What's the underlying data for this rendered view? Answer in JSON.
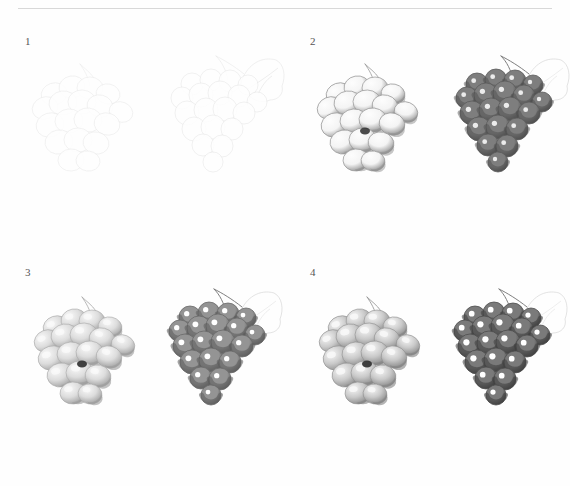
{
  "document": {
    "kind": "art-instruction-page",
    "background_color": "#fefefe",
    "rule_color": "#d8d8d8",
    "subject": "grapes"
  },
  "panels": [
    {
      "number": "1",
      "stage_name": "outline",
      "figures": [
        {
          "id": "green-grapes",
          "variety_label": "light grapes",
          "outline_color": "#e8e8e8",
          "fill_color": "#ffffff",
          "highlight_color": "#ffffff",
          "shadow_color": "#f2f2f2",
          "berries": 16,
          "has_leaf": false,
          "has_stem": true
        },
        {
          "id": "dark-grapes",
          "variety_label": "dark grapes",
          "outline_color": "#e4e4e4",
          "fill_color": "#ffffff",
          "highlight_color": "#ffffff",
          "shadow_color": "#f0f0f0",
          "berries": 20,
          "has_leaf": true,
          "has_stem": true
        }
      ]
    },
    {
      "number": "2",
      "stage_name": "first tone",
      "figures": [
        {
          "id": "green-grapes",
          "variety_label": "light grapes",
          "outline_color": "#9a9a9a",
          "fill_color": "#f4f4f4",
          "highlight_color": "#fdfdfd",
          "shadow_color": "#8d8d8d",
          "berries": 16,
          "has_leaf": false,
          "has_stem": true
        },
        {
          "id": "dark-grapes",
          "variety_label": "dark grapes",
          "outline_color": "#5c5c5c",
          "fill_color": "#7e7e7e",
          "highlight_color": "#ffffff",
          "shadow_color": "#4a4a4a",
          "berries": 20,
          "has_leaf": true,
          "has_stem": true
        }
      ]
    },
    {
      "number": "3",
      "stage_name": "modelling",
      "figures": [
        {
          "id": "green-grapes",
          "variety_label": "light grapes",
          "outline_color": "#a8a8a8",
          "fill_color": "#dcdcdc",
          "highlight_color": "#fafafa",
          "shadow_color": "#9c9c9c",
          "berries": 16,
          "has_leaf": false,
          "has_stem": true
        },
        {
          "id": "dark-grapes",
          "variety_label": "dark grapes",
          "outline_color": "#6a6a6a",
          "fill_color": "#949494",
          "highlight_color": "#ffffff",
          "shadow_color": "#5a5a5a",
          "berries": 20,
          "has_leaf": true,
          "has_stem": true
        }
      ]
    },
    {
      "number": "4",
      "stage_name": "finished",
      "figures": [
        {
          "id": "green-grapes",
          "variety_label": "light grapes",
          "outline_color": "#8f8f8f",
          "fill_color": "#c9c9c9",
          "highlight_color": "#f7f7f7",
          "shadow_color": "#858585",
          "berries": 16,
          "has_leaf": false,
          "has_stem": true
        },
        {
          "id": "dark-grapes",
          "variety_label": "dark grapes",
          "outline_color": "#4e4e4e",
          "fill_color": "#7a7a7a",
          "highlight_color": "#ffffff",
          "shadow_color": "#3c3c3c",
          "berries": 20,
          "has_leaf": true,
          "has_stem": true
        }
      ]
    }
  ]
}
